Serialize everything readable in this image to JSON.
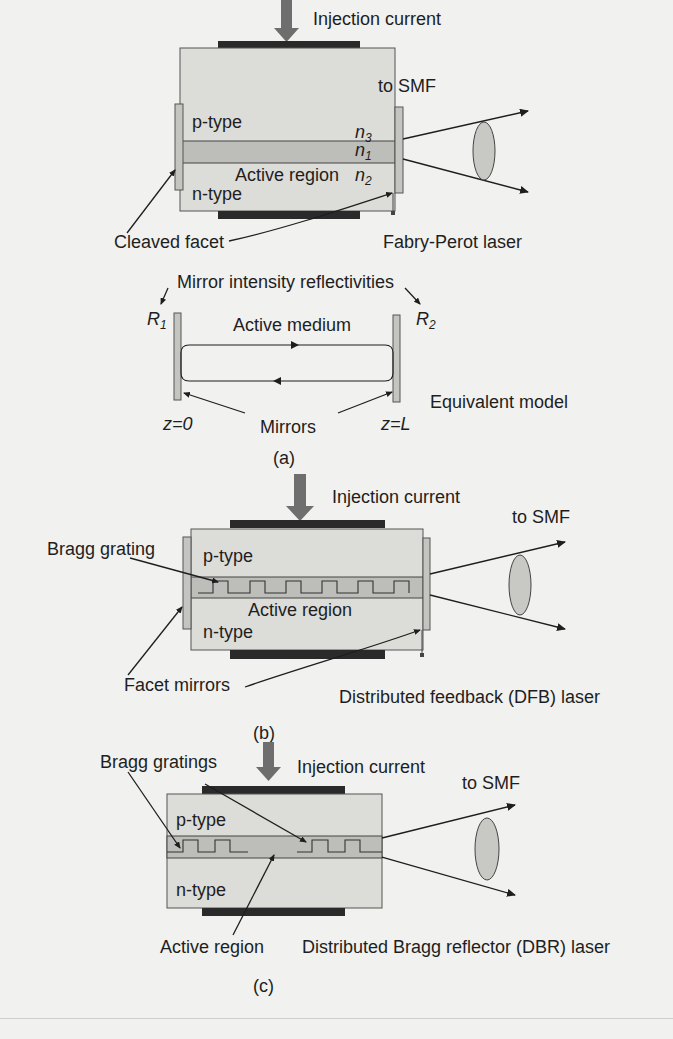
{
  "figure": {
    "colors": {
      "background": "#f1f1ef",
      "body": "#dcdcd9",
      "active": "#bdbdba",
      "electrode": "#2a2a2a",
      "arrow": "#6e6e6e",
      "facet": "#c4c4c1",
      "lens": "#c8c8c5",
      "line": "#1e1e1e"
    },
    "panel_a": {
      "caption": "(a)",
      "injection_label": "Injection current",
      "output_label": "to SMF",
      "p_type": "p-type",
      "n_type": "n-type",
      "active_region": "Active region",
      "n3": "n",
      "n3_sub": "3",
      "n1": "n",
      "n1_sub": "1",
      "n2": "n",
      "n2_sub": "2",
      "cleaved_facet": "Cleaved facet",
      "laser_type": "Fabry-Perot laser",
      "model": {
        "reflectivities_label": "Mirror intensity reflectivities",
        "r1": "R",
        "r1_sub": "1",
        "r2": "R",
        "r2_sub": "2",
        "medium_label": "Active medium",
        "z0": "z=0",
        "zL_prefix": "z=",
        "zL_var": "L",
        "mirrors_label": "Mirrors",
        "title": "Equivalent model"
      }
    },
    "panel_b": {
      "caption": "(b)",
      "injection_label": "Injection current",
      "output_label": "to SMF",
      "grating_label": "Bragg grating",
      "p_type": "p-type",
      "n_type": "n-type",
      "active_region": "Active region",
      "facet_label": "Facet mirrors",
      "laser_type": "Distributed feedback (DFB) laser"
    },
    "panel_c": {
      "caption": "(c)",
      "injection_label": "Injection current",
      "output_label": "to SMF",
      "grating_label": "Bragg gratings",
      "p_type": "p-type",
      "n_type": "n-type",
      "active_region": "Active region",
      "laser_type": "Distributed Bragg reflector (DBR) laser"
    }
  }
}
